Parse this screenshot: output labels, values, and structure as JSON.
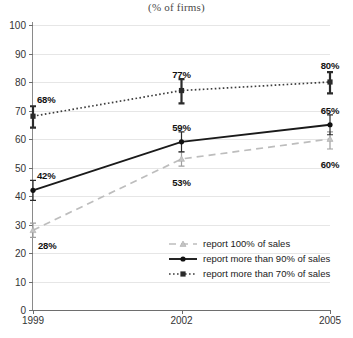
{
  "chart_data": {
    "type": "line",
    "title": "(% of firms)",
    "xlabel": "",
    "ylabel": "",
    "categories": [
      "1999",
      "2002",
      "2005"
    ],
    "x": [
      1999,
      2002,
      2005
    ],
    "ylim": [
      0,
      100
    ],
    "ytick_labels": [
      "0",
      "10",
      "20",
      "30",
      "40",
      "50",
      "60",
      "70",
      "80",
      "90",
      "100"
    ],
    "yticks": [
      0,
      10,
      20,
      30,
      40,
      50,
      60,
      70,
      80,
      90,
      100
    ],
    "grid": true,
    "legend_position": "inside-lower-right",
    "series": [
      {
        "name": "report 100% of sales",
        "style": "dashed",
        "marker": "triangle",
        "color": "#bdbdbd",
        "values": [
          28,
          53,
          60
        ],
        "labels": [
          "28%",
          "53%",
          "60%"
        ],
        "errors_low": [
          25.5,
          50.5,
          56.5
        ],
        "errors_high": [
          30.5,
          55.5,
          62.5
        ]
      },
      {
        "name": "report more than 90% of sales",
        "style": "solid",
        "marker": "circle",
        "color": "#1a1a1a",
        "values": [
          42,
          59,
          65
        ],
        "labels": [
          "42%",
          "59%",
          "65%"
        ],
        "errors_low": [
          38.5,
          55.5,
          61.5
        ],
        "errors_high": [
          45.5,
          62.5,
          68.5
        ]
      },
      {
        "name": "report more than 70% of sales",
        "style": "dotted",
        "marker": "square",
        "color": "#3d3d3d",
        "values": [
          68,
          77,
          80
        ],
        "labels": [
          "68%",
          "77%",
          "80%"
        ],
        "errors_low": [
          64.0,
          72.5,
          76.0
        ],
        "errors_high": [
          71.5,
          81.0,
          83.5
        ]
      }
    ],
    "annotations": [
      {
        "text": "68%",
        "series": 2,
        "index": 0
      },
      {
        "text": "42%",
        "series": 1,
        "index": 0
      },
      {
        "text": "28%",
        "series": 0,
        "index": 0
      },
      {
        "text": "77%",
        "series": 2,
        "index": 1
      },
      {
        "text": "59%",
        "series": 1,
        "index": 1
      },
      {
        "text": "53%",
        "series": 0,
        "index": 1
      },
      {
        "text": "80%",
        "series": 2,
        "index": 2
      },
      {
        "text": "65%",
        "series": 1,
        "index": 2
      },
      {
        "text": "60%",
        "series": 0,
        "index": 2
      }
    ]
  },
  "colors": {
    "axis": "#6e6e6e",
    "grid": "#e6e6e6",
    "background": "#ffffff",
    "label_text": "#111111"
  }
}
